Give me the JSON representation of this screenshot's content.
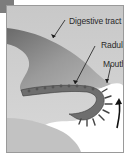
{
  "diagram": {
    "labels": {
      "digestive_tract": "Digestive tract",
      "radula": "Radula",
      "mouth": "Mouth"
    },
    "arrow": "curved upward motion arrow",
    "colors": {
      "background": "#cfcfcf",
      "body": "#8a8a8a",
      "radula": "#6e6e6e",
      "opening": "#ffffff",
      "tab": "#7c7c7c",
      "ink": "#1a1a1a"
    }
  }
}
